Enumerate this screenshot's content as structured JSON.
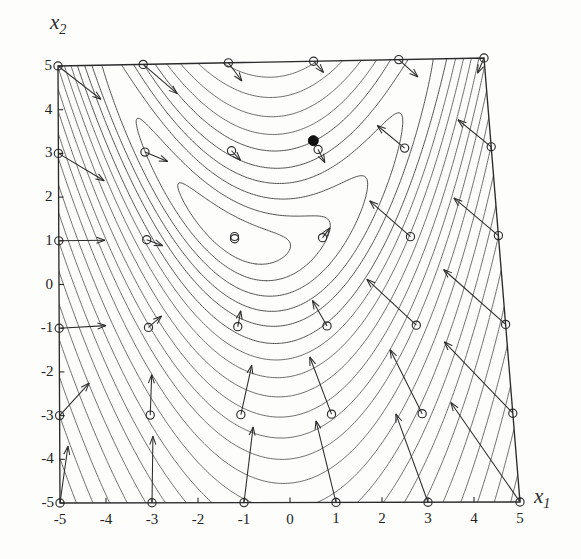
{
  "figure": {
    "kind": "contour-plot-with-gradient-field",
    "axis_titles": {
      "x": "x",
      "x_sub": "1",
      "y": "x",
      "y_sub": "2"
    },
    "background_color": "#fdfdfc",
    "ink_color": "#2b2b2b",
    "contour_color": "#3a3a3a",
    "marker_color": "#222222"
  },
  "chart_data": {
    "type": "line",
    "title": "",
    "subtitle": "",
    "xlabel": "x1",
    "ylabel": "x2",
    "xlim": [
      -5,
      5
    ],
    "ylim": [
      -5,
      5
    ],
    "grid": false,
    "legend_position": "none",
    "xticks": [
      -5,
      -4,
      -3,
      -2,
      -1,
      0,
      1,
      2,
      3,
      4,
      5
    ],
    "xtick_labels": [
      "-5",
      "-4",
      "-3",
      "-2",
      "-1",
      "0",
      "1",
      "2",
      "3",
      "4",
      "5"
    ],
    "yticks": [
      -5,
      -4,
      -3,
      -2,
      -1,
      0,
      1,
      2,
      3,
      4,
      5
    ],
    "ytick_labels": [
      "-5",
      "-4",
      "-3",
      "-2",
      "-1",
      "0",
      "1",
      "2",
      "3",
      "4",
      "5"
    ],
    "contour_description": "nested banana-shaped level curves of a Rosenbrock-type function, densely packed toward the lower-left and right edges, opening toward the upper right",
    "contour_levels": [
      2,
      6,
      12,
      20,
      30,
      44,
      60,
      80,
      105,
      135,
      170,
      210,
      260,
      320,
      390,
      470,
      560,
      670,
      800,
      950,
      1120,
      1320,
      1550,
      1820,
      2120,
      2460,
      2850,
      3300,
      3800,
      4400
    ],
    "valley_center": {
      "x": -1.0,
      "y": 1.05,
      "marker": "open-circle"
    },
    "minimum_point": {
      "x": 0.9,
      "y": 3.2,
      "marker": "filled-dot"
    },
    "sample_grid": {
      "x": [
        -5,
        -3,
        -1,
        1,
        3,
        5
      ],
      "y": [
        -5,
        -3,
        -1,
        1,
        3,
        5
      ],
      "marker": "open-circle",
      "annotation": "each sample point carries an arrow showing the negative gradient / search direction"
    },
    "gradient_arrows": [
      {
        "x": -5,
        "y": 5,
        "dx": 1.0,
        "dy": -0.78,
        "len": 1.27
      },
      {
        "x": -3,
        "y": 5,
        "dx": 0.78,
        "dy": -0.68,
        "len": 1.03
      },
      {
        "x": -1,
        "y": 5,
        "dx": 0.3,
        "dy": -0.42,
        "len": 0.52
      },
      {
        "x": 1,
        "y": 5,
        "dx": 0.22,
        "dy": -0.26,
        "len": 0.34
      },
      {
        "x": 3,
        "y": 5,
        "dx": 0.42,
        "dy": -0.4,
        "len": 0.58
      },
      {
        "x": 5,
        "y": 5,
        "dx": -0.18,
        "dy": -0.34,
        "len": 0.38
      },
      {
        "x": -5,
        "y": 3,
        "dx": 1.05,
        "dy": -0.64,
        "len": 1.23
      },
      {
        "x": -3,
        "y": 3,
        "dx": 0.52,
        "dy": -0.22,
        "len": 0.57
      },
      {
        "x": -1,
        "y": 3,
        "dx": 0.2,
        "dy": -0.22,
        "len": 0.3
      },
      {
        "x": 1,
        "y": 3,
        "dx": 0.14,
        "dy": -0.3,
        "len": 0.33
      },
      {
        "x": 3,
        "y": 3,
        "dx": -0.6,
        "dy": 0.52,
        "len": 0.79
      },
      {
        "x": 5,
        "y": 3,
        "dx": -0.72,
        "dy": 0.62,
        "len": 0.95
      },
      {
        "x": -5,
        "y": 1,
        "dx": 1.05,
        "dy": 0.0,
        "len": 1.05
      },
      {
        "x": -3,
        "y": 1,
        "dx": 0.36,
        "dy": -0.14,
        "len": 0.39
      },
      {
        "x": -1,
        "y": 1,
        "dx": 0.0,
        "dy": 0.0,
        "len": 0.0
      },
      {
        "x": 1,
        "y": 1,
        "dx": 0.18,
        "dy": 0.22,
        "len": 0.28
      },
      {
        "x": 3,
        "y": 1,
        "dx": -0.88,
        "dy": 0.82,
        "len": 1.2
      },
      {
        "x": 5,
        "y": 1,
        "dx": -0.95,
        "dy": 0.86,
        "len": 1.28
      },
      {
        "x": -5,
        "y": -1,
        "dx": 1.05,
        "dy": 0.05,
        "len": 1.05
      },
      {
        "x": -3,
        "y": -1,
        "dx": 0.3,
        "dy": 0.26,
        "len": 0.4
      },
      {
        "x": -1,
        "y": -1,
        "dx": 0.08,
        "dy": 0.36,
        "len": 0.37
      },
      {
        "x": 1,
        "y": -1,
        "dx": -0.3,
        "dy": 0.58,
        "len": 0.65
      },
      {
        "x": 3,
        "y": -1,
        "dx": -1.05,
        "dy": 1.05,
        "len": 1.48
      },
      {
        "x": 5,
        "y": -1,
        "dx": -1.3,
        "dy": 1.25,
        "len": 1.8
      },
      {
        "x": -5,
        "y": -3,
        "dx": 0.66,
        "dy": 0.74,
        "len": 0.99
      },
      {
        "x": -3,
        "y": -3,
        "dx": 0.05,
        "dy": 0.92,
        "len": 0.92
      },
      {
        "x": -1,
        "y": -3,
        "dx": 0.28,
        "dy": 1.12,
        "len": 1.15
      },
      {
        "x": 1,
        "y": -3,
        "dx": -0.42,
        "dy": 1.3,
        "len": 1.37
      },
      {
        "x": 3,
        "y": -3,
        "dx": -0.62,
        "dy": 1.45,
        "len": 1.58
      },
      {
        "x": 5,
        "y": -3,
        "dx": -1.4,
        "dy": 1.62,
        "len": 2.14
      },
      {
        "x": -5,
        "y": -5,
        "dx": 0.18,
        "dy": 1.3,
        "len": 1.31
      },
      {
        "x": -3,
        "y": -5,
        "dx": 0.05,
        "dy": 1.52,
        "len": 1.52
      },
      {
        "x": -1,
        "y": -5,
        "dx": 0.26,
        "dy": 1.72,
        "len": 1.74
      },
      {
        "x": 1,
        "y": -5,
        "dx": -0.35,
        "dy": 1.85,
        "len": 1.88
      },
      {
        "x": 3,
        "y": -5,
        "dx": -0.58,
        "dy": 2.0,
        "len": 2.08
      },
      {
        "x": 5,
        "y": -5,
        "dx": -1.35,
        "dy": 2.25,
        "len": 2.62
      }
    ]
  }
}
